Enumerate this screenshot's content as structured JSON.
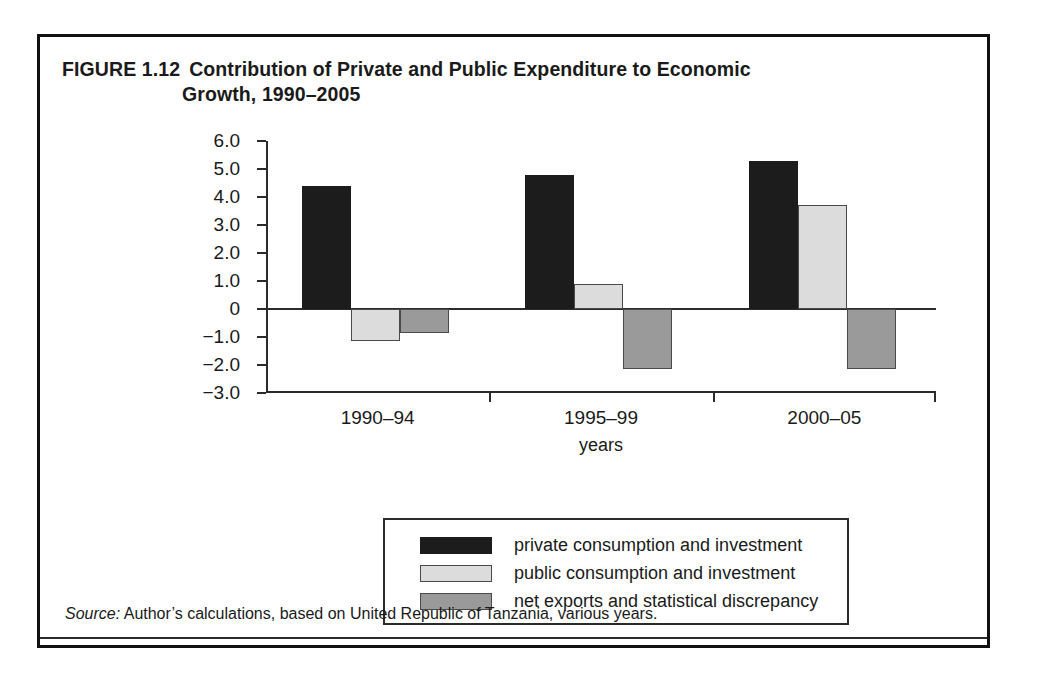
{
  "figure": {
    "number": "FIGURE 1.12",
    "title_line1": "Contribution of Private and Public Expenditure to Economic",
    "title_line2": "Growth, 1990–2005",
    "source_word": "Source:",
    "source_text": " Author’s calculations, based on United Republic of Tanzania, various years."
  },
  "chart_data": {
    "type": "bar",
    "xlabel": "years",
    "ylabel": "percent",
    "categories": [
      "1990–94",
      "1995–99",
      "2000–05"
    ],
    "series": [
      {
        "name": "private consumption and investment",
        "color": "#1c1c1c",
        "values": [
          4.4,
          4.8,
          5.3
        ]
      },
      {
        "name": "public consumption and investment",
        "color": "#dcdcdc",
        "values": [
          -1.15,
          0.9,
          3.7
        ]
      },
      {
        "name": "net exports and statistical discrepancy",
        "color": "#9a9a9a",
        "values": [
          -0.85,
          -2.15,
          -2.15
        ]
      }
    ],
    "ylim": [
      -3.0,
      6.0
    ],
    "ytick_labels": [
      "6.0",
      "5.0",
      "4.0",
      "3.0",
      "2.0",
      "1.0",
      "0",
      "−1.0",
      "−2.0",
      "−3.0"
    ],
    "ytick_values": [
      6.0,
      5.0,
      4.0,
      3.0,
      2.0,
      1.0,
      0,
      -1.0,
      -2.0,
      -3.0
    ],
    "grid": false,
    "legend_position": "bottom"
  }
}
